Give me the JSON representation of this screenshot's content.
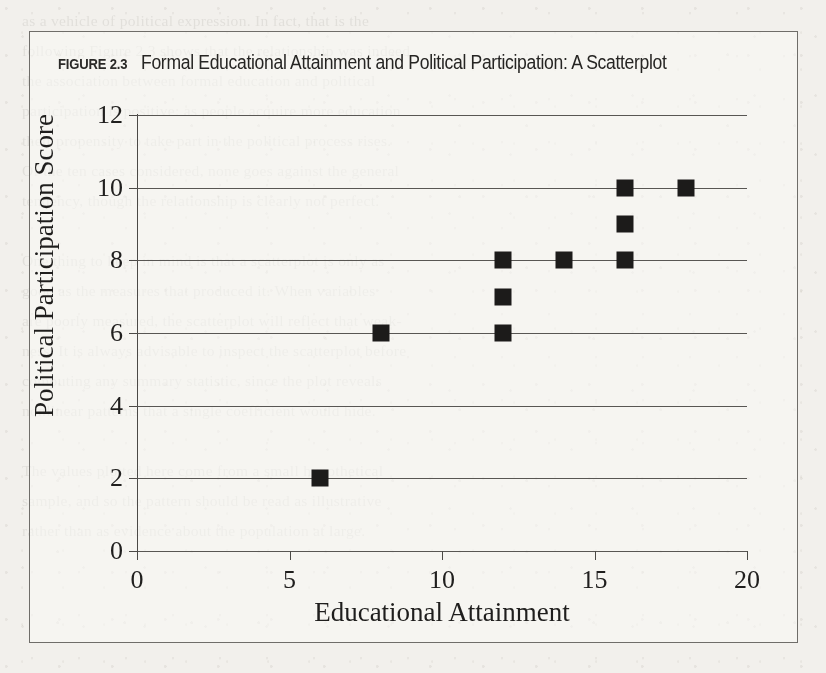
{
  "figure": {
    "label": "FIGURE 2.3",
    "title": "Formal Educational Attainment and Political Participation: A Scatterplot"
  },
  "background_text": "as a vehicle of political expression. In fact, that is the\nfollowing Figure 2.3 shows that the relationship was indeed\nthe association between formal education and political\nparticipation is positive: as people acquire more education\ntheir propensity to take part in the political process rises.\nOf the ten cases considered, none goes against the general\ntendency, though the relationship is clearly not perfect.\n\nOne thing to keep in mind is that a scatterplot is only as\ngood as the measures that produced it. When variables\nare poorly measured, the scatterplot will reflect that weak-\nness. It is always advisable to inspect the scatterplot before\ncomputing any summary statistic, since the plot reveals\nnonlinear patterns that a single coefficient would hide.\n\nThe values plotted here come from a small hypothetical\nsample, and so the pattern should be read as illustrative\nrather than as evidence about the population at large.",
  "chart_data": {
    "type": "scatter",
    "title": "Formal Educational Attainment and Political Participation: A Scatterplot",
    "xlabel": "Educational Attainment",
    "ylabel": "Political Participation Score",
    "xlim": [
      0,
      20
    ],
    "ylim": [
      0,
      12
    ],
    "xticks": [
      0,
      5,
      10,
      15,
      20
    ],
    "yticks": [
      0,
      2,
      4,
      6,
      8,
      10,
      12
    ],
    "xtick_labels": [
      "0",
      "5",
      "10",
      "15",
      "20"
    ],
    "ytick_labels": [
      "0",
      "2",
      "4",
      "6",
      "8",
      "10",
      "12"
    ],
    "grid": "horizontal",
    "legend": "none",
    "marker": "filled-square",
    "marker_color": "#1c1b1a",
    "points": [
      {
        "x": 6,
        "y": 2
      },
      {
        "x": 8,
        "y": 6
      },
      {
        "x": 12,
        "y": 6
      },
      {
        "x": 12,
        "y": 7
      },
      {
        "x": 12,
        "y": 8
      },
      {
        "x": 14,
        "y": 8
      },
      {
        "x": 16,
        "y": 8
      },
      {
        "x": 16,
        "y": 9
      },
      {
        "x": 16,
        "y": 10
      },
      {
        "x": 18,
        "y": 10
      }
    ]
  }
}
